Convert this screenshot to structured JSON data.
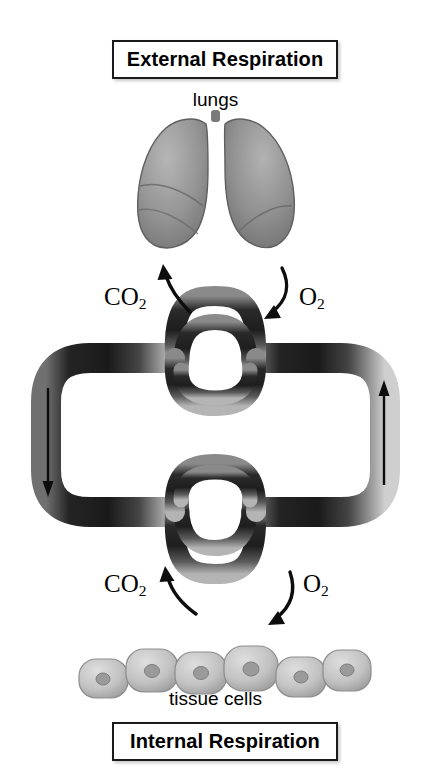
{
  "diagram": {
    "title_top": "External Respiration",
    "title_bottom": "Internal Respiration",
    "organ_label": "lungs",
    "tissue_label": "tissue cells",
    "gases": {
      "carbon_dioxide_symbol": "CO",
      "carbon_dioxide_subscript": "2",
      "oxygen_symbol": "O",
      "oxygen_subscript": "2"
    },
    "flow": {
      "left_direction": "down",
      "right_direction": "up",
      "top_exchange": {
        "out_of_blood": "CO2",
        "into_blood": "O2"
      },
      "bottom_exchange": {
        "out_of_tissue": "CO2",
        "into_tissue": "O2"
      }
    },
    "colors": {
      "background": "#ffffff",
      "vessel_dark": "#2b2b2b",
      "vessel_highlight": "#9a9a9a",
      "lung_fill": "#8e8e8e",
      "cell_fill": "#bdbdbd",
      "cell_nucleus": "#8a8a8a",
      "text": "#000000",
      "box_border": "#1a1a1a"
    },
    "structures": {
      "vessel_loop": "circulatory-loop",
      "upper_capillary_bed": "pulmonary-capillaries",
      "lower_capillary_bed": "systemic-capillaries",
      "cell_count": 6
    }
  }
}
